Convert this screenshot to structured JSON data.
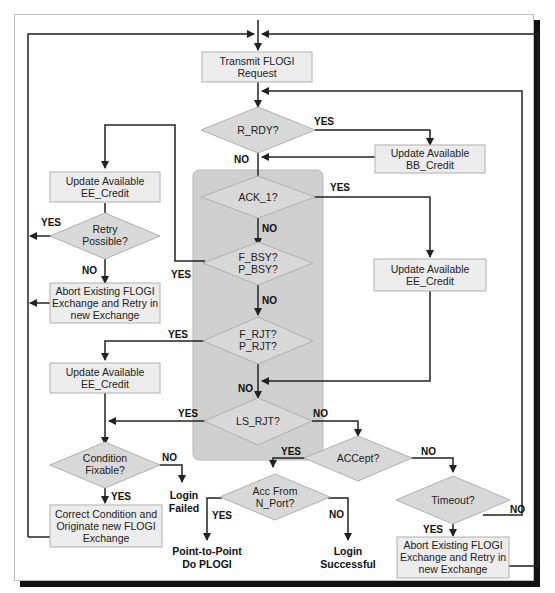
{
  "diagram": {
    "colors": {
      "process_fill": "#ececec",
      "decision_fill": "#d8d8d8",
      "group_fill": "#cfcfcf",
      "line": "#222222",
      "shadow": "#111111"
    },
    "process_boxes": {
      "transmit": [
        "Transmit FLOGI",
        "Request"
      ],
      "update_bb": [
        "Update Available",
        "BB_Credit"
      ],
      "update_ee_top_left": [
        "Update Available",
        "EE_Credit"
      ],
      "update_ee_right": [
        "Update Available",
        "EE_Credit"
      ],
      "abort_left": [
        "Abort Existing FLOGI",
        "Exchange and Retry in",
        "new Exchange"
      ],
      "update_ee_mid_left": [
        "Update Available",
        "EE_Credit"
      ],
      "correct_condition": [
        "Correct Condition and",
        "Originate new FLOGI",
        "Exchange"
      ],
      "abort_bottom_right": [
        "Abort Existing FLOGI",
        "Exchange and Retry in",
        "new Exchange"
      ]
    },
    "decisions": {
      "r_rdy": [
        "R_RDY?"
      ],
      "ack_1": [
        "ACK_1?"
      ],
      "busy": [
        "F_BSY?",
        "P_BSY?"
      ],
      "reject": [
        "F_RJT?",
        "P_RJT?"
      ],
      "retry": [
        "Retry",
        "Possible?"
      ],
      "ls_rjt": [
        "LS_RJT?"
      ],
      "condition": [
        "Condition",
        "Fixable?"
      ],
      "accept": [
        "ACCept?"
      ],
      "acc_from": [
        "Acc From",
        "N_Port?"
      ],
      "timeout": [
        "Timeout?"
      ]
    },
    "terminals": {
      "login_failed": [
        "Login",
        "Failed"
      ],
      "point_to_point": [
        "Point-to-Point",
        "Do PLOGI"
      ],
      "login_successful": [
        "Login",
        "Successful"
      ]
    },
    "edge_labels": {
      "yes": "YES",
      "no": "NO"
    }
  }
}
